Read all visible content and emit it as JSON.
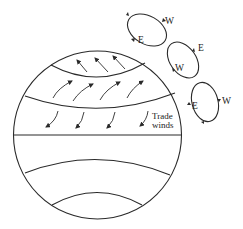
{
  "diagram": {
    "type": "atmospheric-circulation",
    "labels": {
      "trade_winds_line1": "Trade",
      "trade_winds_line2": "winds"
    },
    "cells": [
      {
        "name": "cell-1",
        "labels": [
          {
            "text": "W",
            "pos": "top-right"
          },
          {
            "text": "E",
            "pos": "bottom-left"
          }
        ]
      },
      {
        "name": "cell-2",
        "labels": [
          {
            "text": "E",
            "pos": "top-right"
          },
          {
            "text": "W",
            "pos": "bottom-left"
          }
        ]
      },
      {
        "name": "cell-3",
        "labels": [
          {
            "text": "E",
            "pos": "left"
          },
          {
            "text": "W",
            "pos": "right"
          }
        ]
      }
    ],
    "globe_bands": [
      "polar easterlies band",
      "westerlies band",
      "trade winds band",
      "equator",
      "southern band 1",
      "southern band 2"
    ],
    "colors": {
      "stroke": "#2a2a2a",
      "background": "#ffffff"
    }
  }
}
